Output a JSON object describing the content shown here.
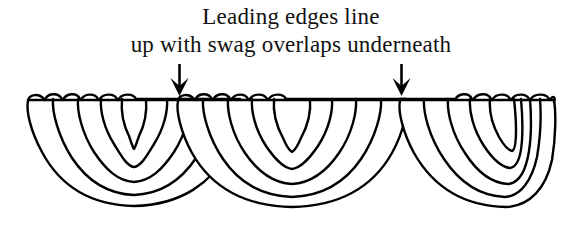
{
  "figure": {
    "background_color": "#ffffff",
    "ink_color": "#000000",
    "width": 582,
    "height": 229
  },
  "caption": {
    "line1": "Leading edges line",
    "line2": "up with swag overlaps underneath",
    "full_text": "Leading edges line up with swag overlaps underneath",
    "font_style": "serif",
    "text_color": "#111111"
  },
  "annotations": {
    "arrows": [
      {
        "name": "left-pointer-arrow",
        "glyph": "arrow-down-icon",
        "direction": "down",
        "x": 179,
        "y_top": 64,
        "y_tip": 96,
        "points_at": "left swag overlap junction"
      },
      {
        "name": "right-pointer-arrow",
        "glyph": "arrow-down-icon",
        "direction": "down",
        "x": 401,
        "y_top": 64,
        "y_tip": 96,
        "points_at": "right swag overlap junction"
      }
    ]
  },
  "drawing": {
    "type": "line-art",
    "stroke_color": "#000000",
    "fill_color": "#ffffff",
    "stroke_width": 2.4,
    "top_rail_y": 98,
    "swags": [
      {
        "name": "left-swag",
        "index": 1,
        "left_x": 28,
        "right_x": 240,
        "top_y": 98,
        "bottom_y": 207,
        "arc_count": 5,
        "pleat_count": 6,
        "z": 1
      },
      {
        "name": "center-swag",
        "index": 2,
        "left_x": 178,
        "right_x": 414,
        "top_y": 98,
        "bottom_y": 207,
        "arc_count": 5,
        "pleat_count": 6,
        "z": 2
      },
      {
        "name": "right-swag",
        "index": 3,
        "left_x": 400,
        "right_x": 554,
        "top_y": 98,
        "bottom_y": 207,
        "arc_count": 5,
        "pleat_count": 5,
        "z": 3
      }
    ]
  }
}
